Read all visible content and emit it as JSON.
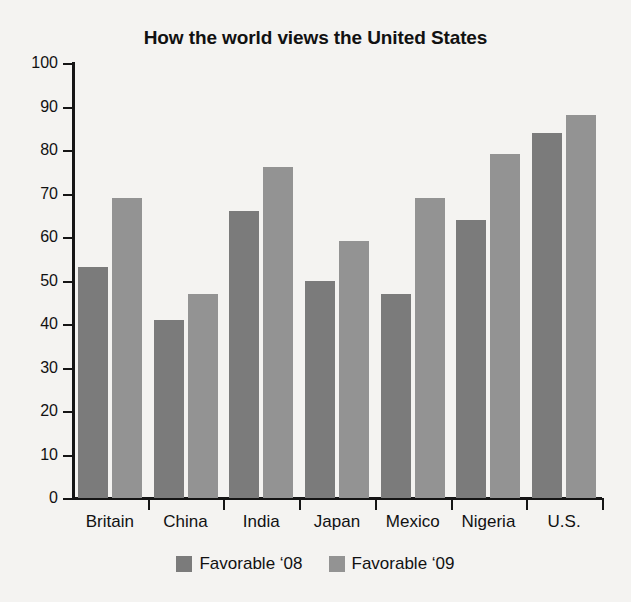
{
  "chart_data": {
    "type": "bar",
    "title": "How the world views the United States",
    "xlabel": "",
    "ylabel": "",
    "ylim": [
      0,
      100
    ],
    "ytick_step": 10,
    "yticks": [
      100,
      90,
      80,
      70,
      60,
      50,
      40,
      30,
      20,
      10,
      0
    ],
    "grid": false,
    "legend_position": "bottom-center",
    "categories": [
      "Britain",
      "China",
      "India",
      "Japan",
      "Mexico",
      "Nigeria",
      "U.S."
    ],
    "series": [
      {
        "name": "Favorable ‘08",
        "color": "#7b7b7b",
        "values": [
          53,
          41,
          66,
          50,
          47,
          64,
          84
        ]
      },
      {
        "name": "Favorable ‘09",
        "color": "#939393",
        "values": [
          69,
          47,
          76,
          59,
          69,
          79,
          88
        ]
      }
    ]
  },
  "legend": {
    "entries": [
      {
        "label": "Favorable ‘08",
        "color": "#7b7b7b"
      },
      {
        "label": "Favorable ‘09",
        "color": "#939393"
      }
    ]
  },
  "colors": {
    "background": "#f4f3f1",
    "axis": "#151515",
    "text": "#111111",
    "series_08": "#7b7b7b",
    "series_09": "#939393"
  }
}
